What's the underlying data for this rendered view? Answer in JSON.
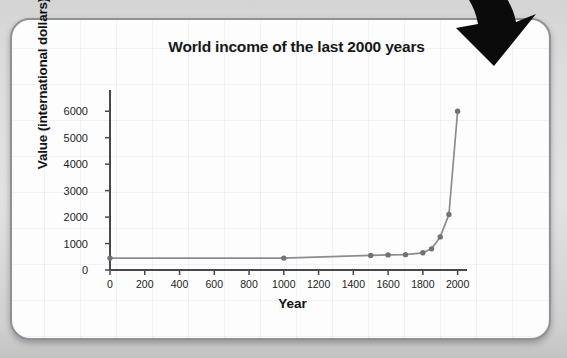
{
  "card": {
    "border_color": "#8e9196",
    "background_color": "#fdfdfd"
  },
  "annotation": {
    "arrow_name": "curved-down-left-arrow",
    "arrow_color": "#0b0b0b"
  },
  "chart_data": {
    "type": "line",
    "title": "World income of the last 2000 years",
    "xlabel": "Year",
    "ylabel": "Value (international dollars)",
    "xlim": [
      0,
      2100
    ],
    "ylim": [
      0,
      6500
    ],
    "grid": false,
    "legend": "none",
    "line_color": "#8a8c90",
    "marker_color": "#6f7276",
    "xticks": [
      0,
      200,
      400,
      600,
      800,
      1000,
      1200,
      1400,
      1600,
      1800,
      2000
    ],
    "yticks": [
      0,
      1000,
      2000,
      3000,
      4000,
      5000,
      6000
    ],
    "x": [
      0,
      1000,
      1500,
      1600,
      1700,
      1800,
      1850,
      1900,
      1950,
      2000
    ],
    "values": [
      450,
      450,
      550,
      570,
      580,
      650,
      800,
      1250,
      2100,
      6000
    ],
    "series": [
      {
        "name": "World income",
        "x": [
          0,
          1000,
          1500,
          1600,
          1700,
          1800,
          1850,
          1900,
          1950,
          2000
        ],
        "values": [
          450,
          450,
          550,
          570,
          580,
          650,
          800,
          1250,
          2100,
          6000
        ]
      }
    ]
  }
}
